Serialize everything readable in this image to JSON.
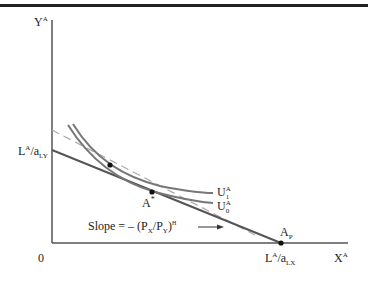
{
  "axes": {
    "y_label": "Y",
    "y_label_sup": "A",
    "x_label": "X",
    "x_label_sup": "A",
    "origin": "0"
  },
  "labels": {
    "y_intercept": {
      "main": "L",
      "sup": "A",
      "mid": "/a",
      "sub": "LY"
    },
    "x_intercept": {
      "main": "L",
      "sup": "A",
      "mid": "/a",
      "sub": "LX"
    },
    "point_a_star": {
      "main": "A",
      "sup": "*"
    },
    "point_ap": {
      "main": "A",
      "sub": "P"
    },
    "u1": {
      "main": "U",
      "sup": "A",
      "sub": "1"
    },
    "u0": {
      "main": "U",
      "sup": "A",
      "sub": "0"
    },
    "slope": {
      "prefix": "Slope = – (P",
      "sub1": "X",
      "mid": "/P",
      "sub2": "Y",
      "close": ")",
      "sup": "H"
    }
  },
  "colors": {
    "axis": "#555555",
    "budget_line": "#555555",
    "indifference": "#777777",
    "dashed": "#aaaaaa",
    "point": "#111111"
  }
}
